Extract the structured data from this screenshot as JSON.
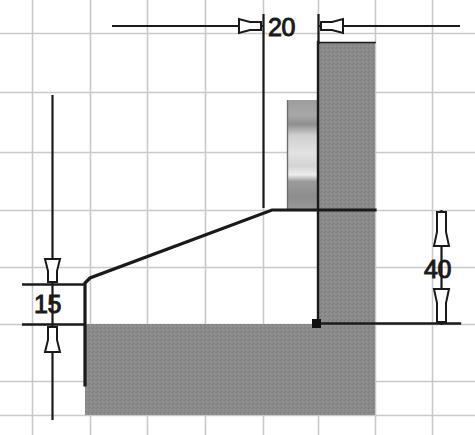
{
  "drawing": {
    "title": "Section view with dimensions",
    "background_color": "#ffffff",
    "grid": {
      "visible": true,
      "color": "#c9c9c9",
      "vertical_x": [
        32,
        90,
        147,
        205,
        263,
        318,
        375,
        432
      ],
      "horizontal_y": [
        33,
        92,
        152,
        210,
        267,
        324,
        381,
        415
      ]
    },
    "colors": {
      "outline": "#1a1a1a",
      "hatch_dark": "#8a8a8a",
      "hatch_light_top": "#9a9a9a",
      "hatch_light_mid": "#d8d8d8",
      "hatch_light_low": "#8f8f8f",
      "dimension_line": "#1a1a1a",
      "grid_line": "#c9c9c9"
    },
    "dimensions": [
      {
        "id": "dim-20",
        "label": "20",
        "orientation": "horizontal",
        "value": 20,
        "arrow_style": "outward",
        "text_x": 262,
        "text_y": 36,
        "line_y": 26,
        "line_x1": 112,
        "line_x2": 460,
        "witness_x": [
          263,
          318
        ]
      },
      {
        "id": "dim-15",
        "label": "15",
        "orientation": "vertical",
        "value": 15,
        "arrow_style": "outward",
        "text_x": 36,
        "text_y": 312,
        "line_x": 52,
        "line_y1": 95,
        "line_y2": 418,
        "witness_y": [
          284,
          324
        ]
      },
      {
        "id": "dim-40",
        "label": "40",
        "orientation": "vertical",
        "value": 40,
        "arrow_style": "inward",
        "text_x": 428,
        "text_y": 277,
        "line_x": 441,
        "line_y1": 210,
        "line_y2": 325,
        "witness_y": [
          210,
          325
        ]
      }
    ],
    "profile": {
      "left_edge_x": 85,
      "shoulder_top_y": 283,
      "base_top_y": 324,
      "base_bottom_y": 415,
      "slope_apex_x": 272,
      "slope_apex_y": 210,
      "column_left_x": 318,
      "column_right_x": 375,
      "column_top_y": 42,
      "top_face_y": 210
    },
    "markers": [
      {
        "id": "endpoint-square",
        "shape": "square",
        "x": 316,
        "y": 323,
        "size": 8,
        "color": "#111111"
      }
    ],
    "hatch_regions": [
      {
        "id": "base-slab",
        "x": 85,
        "y": 324,
        "width": 233,
        "height": 91,
        "fill": "dark"
      },
      {
        "id": "upright-column",
        "x": 318,
        "y": 42,
        "width": 57,
        "height": 373,
        "fill": "dark"
      },
      {
        "id": "inner-gradient-face",
        "x": 287,
        "y": 100,
        "width": 30,
        "height": 110,
        "fill": "gradient"
      }
    ]
  }
}
